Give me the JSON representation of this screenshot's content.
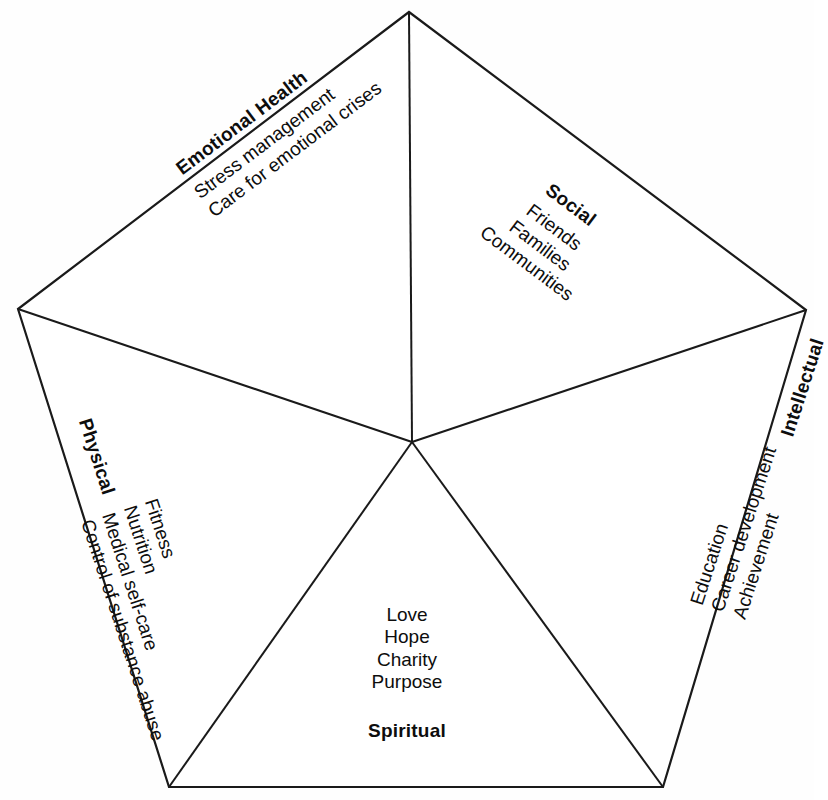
{
  "diagram": {
    "type": "pentagon-wellness-wheel",
    "shape": "pentagon",
    "sector_count": 5,
    "stroke_color": "#1a1a1a",
    "fill_color": "#ffffff",
    "background_color": "#fefefe"
  },
  "sectors": [
    {
      "id": "emotional",
      "title": "Emotional Health",
      "items": [
        "Stress management",
        "Care for emotional crises"
      ],
      "position": "upper-left",
      "rotation_deg": -37
    },
    {
      "id": "social",
      "title": "Social",
      "items": [
        "Friends",
        "Families",
        "Communities"
      ],
      "position": "upper-right",
      "rotation_deg": 37
    },
    {
      "id": "physical",
      "title": "Physical",
      "items": [
        "Fitness",
        "Nutrition",
        "Medical self-care",
        "Control of substance abuse"
      ],
      "position": "left",
      "rotation_deg": 72
    },
    {
      "id": "intellectual",
      "title": "Intellectual",
      "items": [
        "Education",
        "Career development",
        "Achievement"
      ],
      "position": "right",
      "rotation_deg": -72
    },
    {
      "id": "spiritual",
      "title": "Spiritual",
      "items": [
        "Love",
        "Hope",
        "Charity",
        "Purpose"
      ],
      "position": "bottom",
      "rotation_deg": 0
    }
  ],
  "geometry": {
    "center": {
      "x": 412,
      "y": 442
    },
    "vertices": [
      {
        "name": "top",
        "x": 409,
        "y": 12
      },
      {
        "name": "right",
        "x": 806,
        "y": 310
      },
      {
        "name": "bottom-right",
        "x": 663,
        "y": 787
      },
      {
        "name": "bottom-left",
        "x": 169,
        "y": 787
      },
      {
        "name": "left",
        "x": 18,
        "y": 309
      }
    ]
  }
}
